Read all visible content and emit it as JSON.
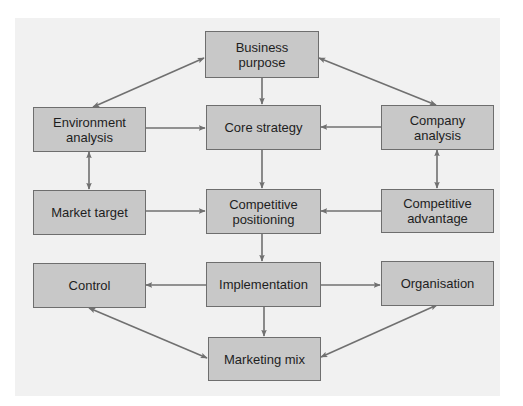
{
  "diagram": {
    "colors": {
      "box_fill": "#c8c8c8",
      "box_border": "#6e6e6e",
      "arrow": "#707070",
      "panel": "#f1f1f1"
    },
    "nodes": {
      "business_purpose": {
        "label": "Business purpose",
        "line1": "Business",
        "line2": "purpose"
      },
      "environment_analysis": {
        "label": "Environment analysis",
        "line1": "Environment",
        "line2": "analysis"
      },
      "core_strategy": {
        "label": "Core strategy"
      },
      "company_analysis": {
        "label": "Company analysis",
        "line1": "Company",
        "line2": "analysis"
      },
      "market_target": {
        "label": "Market target"
      },
      "competitive_positioning": {
        "label": "Competitive positioning",
        "line1": "Competitive",
        "line2": "positioning"
      },
      "competitive_advantage": {
        "label": "Competitive advantage",
        "line1": "Competitive",
        "line2": "advantage"
      },
      "control": {
        "label": "Control"
      },
      "implementation": {
        "label": "Implementation"
      },
      "organisation": {
        "label": "Organisation"
      },
      "marketing_mix": {
        "label": "Marketing mix"
      }
    },
    "edges": [
      {
        "from": "Business purpose",
        "to": "Core strategy",
        "type": "one-way"
      },
      {
        "from": "Business purpose",
        "to": "Environment analysis",
        "type": "two-way"
      },
      {
        "from": "Business purpose",
        "to": "Company analysis",
        "type": "two-way"
      },
      {
        "from": "Environment analysis",
        "to": "Core strategy",
        "type": "one-way"
      },
      {
        "from": "Company analysis",
        "to": "Core strategy",
        "type": "one-way"
      },
      {
        "from": "Environment analysis",
        "to": "Market target",
        "type": "two-way"
      },
      {
        "from": "Company analysis",
        "to": "Competitive advantage",
        "type": "two-way"
      },
      {
        "from": "Core strategy",
        "to": "Competitive positioning",
        "type": "one-way"
      },
      {
        "from": "Market target",
        "to": "Competitive positioning",
        "type": "one-way"
      },
      {
        "from": "Competitive advantage",
        "to": "Competitive positioning",
        "type": "one-way"
      },
      {
        "from": "Competitive positioning",
        "to": "Implementation",
        "type": "one-way"
      },
      {
        "from": "Implementation",
        "to": "Control",
        "type": "one-way"
      },
      {
        "from": "Implementation",
        "to": "Organisation",
        "type": "one-way"
      },
      {
        "from": "Implementation",
        "to": "Marketing mix",
        "type": "one-way"
      },
      {
        "from": "Control",
        "to": "Marketing mix",
        "type": "two-way"
      },
      {
        "from": "Organisation",
        "to": "Marketing mix",
        "type": "two-way"
      }
    ]
  }
}
